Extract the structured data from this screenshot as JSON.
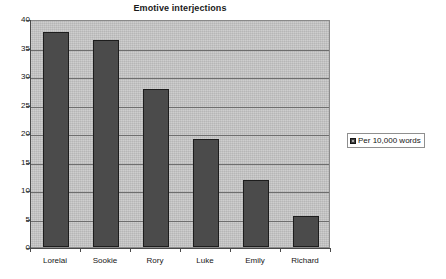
{
  "chart_data": {
    "type": "bar",
    "title": "Emotive interjections",
    "xlabel": "",
    "ylabel": "",
    "categories": [
      "Lorelai",
      "Sookie",
      "Rory",
      "Luke",
      "Emily",
      "Richard"
    ],
    "values": [
      37.8,
      36.4,
      27.8,
      19.0,
      11.8,
      5.4
    ],
    "series": [
      {
        "name": "Per 10,000 words",
        "values": [
          37.8,
          36.4,
          27.8,
          19.0,
          11.8,
          5.4
        ],
        "color": "#4b4b4b"
      }
    ],
    "ylim": [
      0,
      40
    ],
    "ytick_labels": [
      "40",
      "35",
      "30",
      "25",
      "20",
      "15",
      "10",
      "5",
      "0"
    ],
    "ytick_values": [
      40,
      35,
      30,
      25,
      20,
      15,
      10,
      5,
      0
    ],
    "grid": true,
    "grid_axis": "y",
    "legend": {
      "position": "right",
      "entries": [
        "Per 10,000 words"
      ]
    },
    "plot_background_color": "#c3c3c3",
    "bar_color": "#4b4b4b"
  }
}
